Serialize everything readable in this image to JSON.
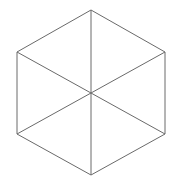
{
  "diagram": {
    "type": "hexagon-triangulation",
    "background": "#ffffff",
    "stroke_color": "#6a6a6a",
    "stroke_width": 1,
    "vertices": {
      "top": [
        91,
        10
      ],
      "upper_right": [
        165,
        52
      ],
      "lower_right": [
        165,
        134
      ],
      "bottom": [
        91,
        175
      ],
      "lower_left": [
        17,
        134
      ],
      "upper_left": [
        17,
        52
      ],
      "center": [
        91,
        93
      ]
    },
    "outline_order": [
      "top",
      "upper_right",
      "lower_right",
      "bottom",
      "lower_left",
      "upper_left"
    ],
    "spokes": [
      "top",
      "upper_right",
      "lower_right",
      "bottom",
      "lower_left",
      "upper_left"
    ]
  }
}
